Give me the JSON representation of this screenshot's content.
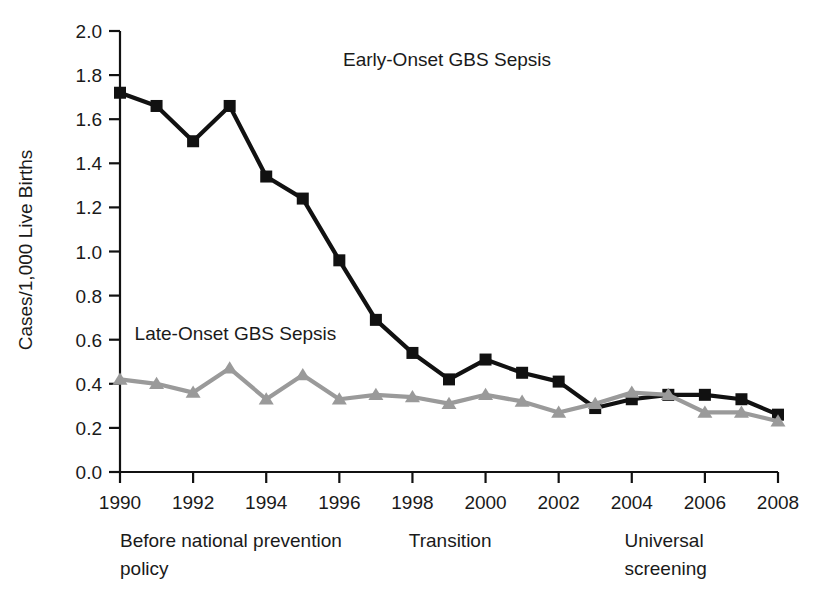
{
  "chart_data": {
    "type": "line",
    "title": "",
    "xlabel": "",
    "ylabel": "Cases/1,000 Live Births",
    "x": [
      1990,
      1991,
      1992,
      1993,
      1994,
      1995,
      1996,
      1997,
      1998,
      1999,
      2000,
      2001,
      2002,
      2003,
      2004,
      2005,
      2006,
      2007,
      2008
    ],
    "xlim": [
      1990,
      2008
    ],
    "ylim": [
      0.0,
      2.0
    ],
    "ytick_labels": [
      "0.0",
      "0.2",
      "0.4",
      "0.6",
      "0.8",
      "1.0",
      "1.2",
      "1.4",
      "1.6",
      "1.8",
      "2.0"
    ],
    "ytick_values": [
      0.0,
      0.2,
      0.4,
      0.6,
      0.8,
      1.0,
      1.2,
      1.4,
      1.6,
      1.8,
      2.0
    ],
    "xtick_labels": [
      "1990",
      "1992",
      "1994",
      "1996",
      "1998",
      "2000",
      "2002",
      "2004",
      "2006",
      "2008"
    ],
    "xtick_values": [
      1990,
      1992,
      1994,
      1996,
      1998,
      2000,
      2002,
      2004,
      2006,
      2008
    ],
    "grid": false,
    "legend_position": "inline-annotation",
    "series": [
      {
        "name": "Early-Onset GBS Sepsis",
        "color": "#111111",
        "marker": "square",
        "label_x": 1996.1,
        "label_y": 1.84,
        "values": [
          1.72,
          1.66,
          1.5,
          1.66,
          1.34,
          1.24,
          0.96,
          0.69,
          0.54,
          0.42,
          0.51,
          0.45,
          0.41,
          0.29,
          0.33,
          0.35,
          0.35,
          0.33,
          0.26
        ]
      },
      {
        "name": "Late-Onset GBS Sepsis",
        "color": "#9a9a9a",
        "marker": "triangle",
        "label_x": 1990.4,
        "label_y": 0.6,
        "values": [
          0.42,
          0.4,
          0.36,
          0.47,
          0.33,
          0.44,
          0.33,
          0.35,
          0.34,
          0.31,
          0.35,
          0.32,
          0.27,
          0.31,
          0.36,
          0.35,
          0.27,
          0.27,
          0.23
        ]
      }
    ],
    "period_annotations": [
      {
        "name": "before-policy",
        "line1": "Before national prevention",
        "line2": "policy",
        "x": 1990.0
      },
      {
        "name": "transition",
        "line1": "Transition",
        "line2": "",
        "x": 1997.9
      },
      {
        "name": "universal-screening",
        "line1": "Universal",
        "line2": "screening",
        "x": 2003.8
      }
    ]
  }
}
